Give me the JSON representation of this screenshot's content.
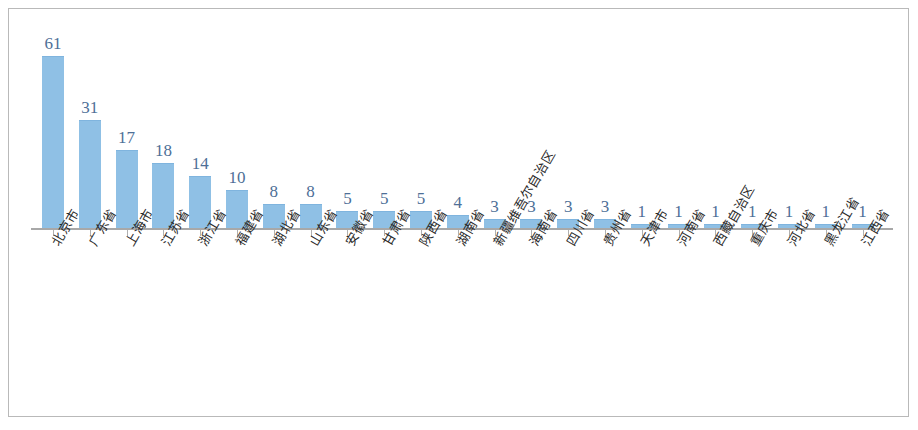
{
  "figure": {
    "frame_border_color": "#b9b9b9",
    "background_color": "#ffffff"
  },
  "chart_data": {
    "type": "bar",
    "title": "",
    "subtitle": "",
    "xlabel": "",
    "ylabel": "",
    "grid": false,
    "legend": false,
    "axis_line_visible": true,
    "y_axis_visible": false,
    "ylim": [
      0,
      61
    ],
    "bar_color": "#8fc0e5",
    "label_color": "#4e6f97",
    "data_labels_shown": true,
    "categories": [
      "北京市",
      "广东省",
      "上海市",
      "江苏省",
      "浙江省",
      "福建省",
      "湖北省",
      "山东省",
      "安徽省",
      "甘肃省",
      "陕西省",
      "湖南省",
      "新疆维吾尔自治区",
      "海南省",
      "四川省",
      "贵州省",
      "天津市",
      "河南省",
      "西藏自治区",
      "重庆市",
      "河北省",
      "黑龙江省",
      "江西省"
    ],
    "values": [
      61,
      31,
      17,
      18,
      14,
      10,
      8,
      8,
      5,
      5,
      5,
      4,
      3,
      3,
      3,
      3,
      1,
      1,
      1,
      1,
      1,
      1,
      1
    ],
    "bar_pixel_heights": [
      172,
      108,
      78,
      65,
      52,
      38,
      24,
      24,
      17,
      17,
      17,
      13,
      9,
      9,
      9,
      9,
      4,
      4,
      4,
      4,
      4,
      4,
      4
    ]
  }
}
